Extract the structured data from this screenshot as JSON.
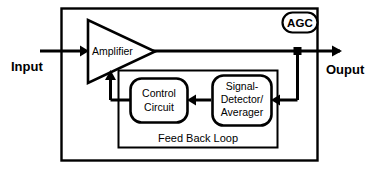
{
  "diagram": {
    "type": "block-diagram",
    "ports": {
      "input_label": "Input",
      "output_label": "Ouput"
    },
    "badge": {
      "label": "AGC"
    },
    "blocks": {
      "amplifier": {
        "label": "Amplifier",
        "shape": "triangle"
      },
      "control_circuit": {
        "line1": "Control",
        "line2": "Circuit",
        "shape": "rounded-rect"
      },
      "signal_detector": {
        "line1": "Signal-",
        "line2": "Detector/",
        "line3": "Averager",
        "shape": "rounded-rect"
      },
      "feedback_loop": {
        "label": "Feed Back Loop",
        "shape": "rect"
      }
    },
    "colors": {
      "stroke": "#000000",
      "background": "#ffffff",
      "text": "#000000"
    }
  }
}
